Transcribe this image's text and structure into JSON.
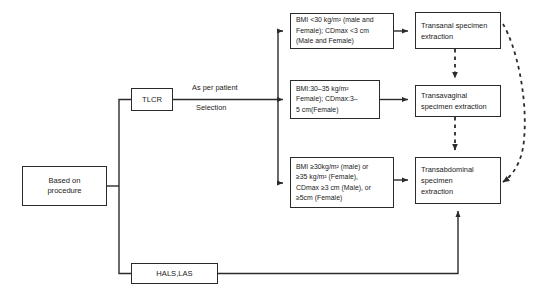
{
  "diagram": {
    "background": "#ffffff",
    "line_color": "#2b2b2b",
    "text_color": "#1a1a1a"
  },
  "nodes": {
    "based_on_procedure": "Based on\nprocedure",
    "tlcr": "TLCR",
    "hals_las": "HALS,LAS",
    "criteria_1": "BMI <30 kg/m² (male and\nFemale); CDmax <3 cm\n(Male and Female)",
    "criteria_2": "BMI:30–35 kg/m²\nFemale); CDmax:3–\n5 cm(Female)",
    "criteria_3": "BMI ≥30kg/m² (male) or\n≥35 kg/m² (Female),\nCDmax ≥3 cm (Male), or\n≥5cm (Female)",
    "transanal": "Transanal specimen\nextraction",
    "transvaginal": "Transavaginal\nspecimen extraction",
    "transabdominal": "Transabdominal\nspecimen\nextraction"
  },
  "edge_labels": {
    "as_per_patient": "As per patient",
    "selection": "Selection"
  },
  "edges": [
    {
      "name": "procedure-to-tlcr",
      "style": "solid",
      "from": "based_on_procedure",
      "to": "tlcr"
    },
    {
      "name": "procedure-to-hals-las",
      "style": "solid",
      "from": "based_on_procedure",
      "to": "hals_las"
    },
    {
      "name": "tlcr-to-criteria-1",
      "style": "solid",
      "from": "tlcr",
      "to": "criteria_1"
    },
    {
      "name": "tlcr-to-criteria-2",
      "style": "solid",
      "from": "tlcr",
      "to": "criteria_2"
    },
    {
      "name": "tlcr-to-criteria-3",
      "style": "solid",
      "from": "tlcr",
      "to": "criteria_3"
    },
    {
      "name": "criteria-1-to-transanal",
      "style": "solid",
      "from": "criteria_1",
      "to": "transanal"
    },
    {
      "name": "criteria-2-to-transvaginal",
      "style": "solid",
      "from": "criteria_2",
      "to": "transvaginal"
    },
    {
      "name": "criteria-3-to-transabdominal",
      "style": "solid",
      "from": "criteria_3",
      "to": "transabdominal"
    },
    {
      "name": "transanal-to-transvaginal",
      "style": "dashed",
      "from": "transanal",
      "to": "transvaginal"
    },
    {
      "name": "transvaginal-to-transabdominal",
      "style": "dashed",
      "from": "transvaginal",
      "to": "transabdominal"
    },
    {
      "name": "transanal-curve-to-transabdominal",
      "style": "dashed",
      "from": "transanal",
      "to": "transabdominal"
    },
    {
      "name": "hals-las-to-transabdominal",
      "style": "solid",
      "from": "hals_las",
      "to": "transabdominal"
    }
  ]
}
